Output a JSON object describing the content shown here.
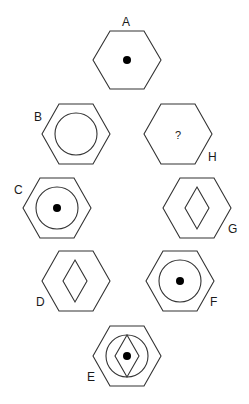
{
  "puzzle": {
    "type": "hexagon sequence / missing figure",
    "figures": [
      {
        "label": "A",
        "contents": [
          "dot"
        ]
      },
      {
        "label": "B",
        "contents": [
          "circle"
        ]
      },
      {
        "label": "C",
        "contents": [
          "circle",
          "dot"
        ]
      },
      {
        "label": "D",
        "contents": [
          "diamond"
        ]
      },
      {
        "label": "E",
        "contents": [
          "circle",
          "diamond",
          "dot"
        ]
      },
      {
        "label": "F",
        "contents": [
          "circle",
          "dot"
        ]
      },
      {
        "label": "G",
        "contents": [
          "diamond"
        ]
      },
      {
        "label": "H",
        "contents": [
          "?"
        ]
      }
    ],
    "labels": {
      "a": "A",
      "b": "B",
      "c": "C",
      "d": "D",
      "e": "E",
      "f": "F",
      "g": "G",
      "h": "H"
    },
    "unknown_mark": "?"
  }
}
